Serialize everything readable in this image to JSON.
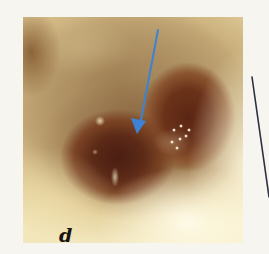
{
  "figure": {
    "panel_label": "d"
  },
  "annotations": {
    "arrow": {
      "color": "#3d82d4",
      "from": [
        158,
        30
      ],
      "to": [
        138,
        132
      ]
    },
    "leader_line": {
      "color": "#2c3040",
      "from": [
        252,
        77
      ],
      "to": [
        269,
        196
      ]
    }
  },
  "colors": {
    "background": "#f7f5f0",
    "tissue": "#c6ab78",
    "cavity": "#5c2a17",
    "rim": "#fffbe6"
  }
}
